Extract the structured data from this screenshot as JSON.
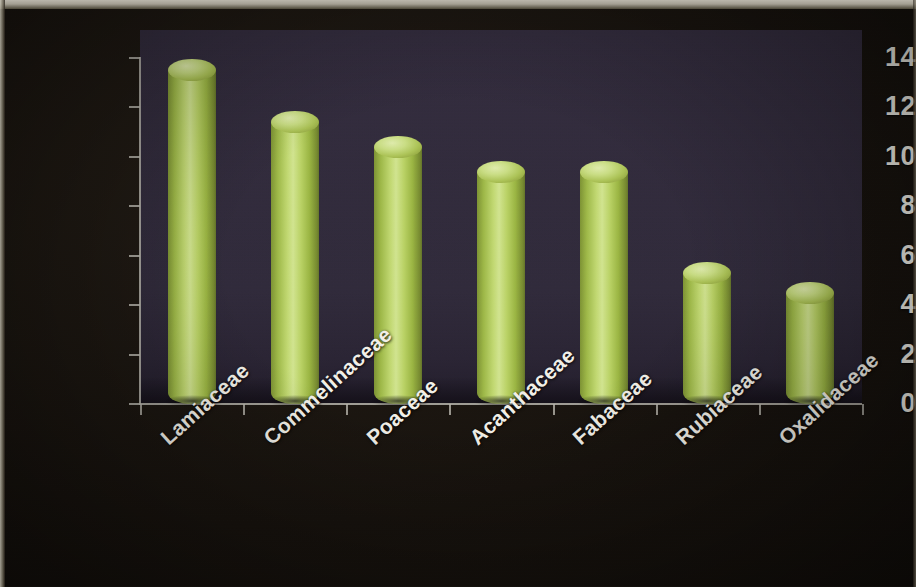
{
  "chart_data": {
    "type": "bar",
    "title": "",
    "subtitle": "",
    "xlabel": "",
    "ylabel": "",
    "categories": [
      "Lamiaceae",
      "Commelinaceae",
      "Poaceae",
      "Acanthaceae",
      "Fabaceae",
      "Rubiaceae",
      "Oxalidaceae"
    ],
    "values": [
      13.5,
      11.4,
      10.4,
      9.4,
      9.4,
      5.3,
      4.5
    ],
    "yticks": [
      "0",
      "2",
      "4",
      "6",
      "8",
      "10",
      "12",
      "14"
    ],
    "ytick_values": [
      0,
      2,
      4,
      6,
      8,
      10,
      12,
      14
    ],
    "ylim": [
      0,
      14
    ],
    "grid": false,
    "legend": null,
    "legend_position": "none",
    "series": [
      {
        "name": "Number of species",
        "values": [
          13.5,
          11.4,
          10.4,
          9.4,
          9.4,
          5.3,
          4.5
        ]
      }
    ]
  },
  "style": {
    "bar_color": "#b5cc5c",
    "bar_highlight_color": "#d3e691",
    "bar_shadow_color": "#63742a",
    "plot_background": "#302a3b",
    "figure_background": "#17120d",
    "axis_color": "#b9b6ae",
    "text_color": "#f2f0e8"
  }
}
